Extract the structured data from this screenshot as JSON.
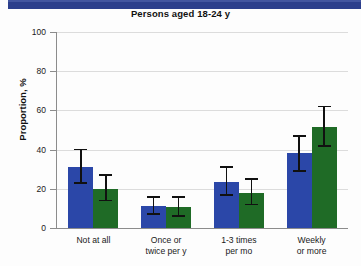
{
  "banner": {
    "color": "#2c3f8c"
  },
  "chart_data": {
    "type": "bar",
    "title": "Persons aged 18-24 y",
    "xlabel": "",
    "ylabel": "Proportion, %",
    "ylim": [
      0,
      100
    ],
    "yticks": [
      0,
      20,
      40,
      60,
      80,
      100
    ],
    "ytick_labels": [
      "0",
      "20",
      "40",
      "60",
      "80",
      "100"
    ],
    "grid": true,
    "legend": null,
    "colors": {
      "series1": "#2b47a8",
      "series2": "#1f6b26"
    },
    "categories": [
      "Not at all",
      "Once or twice per y",
      "1-3 times per mo",
      "Weekly or more"
    ],
    "category_lines": [
      [
        "Not at all"
      ],
      [
        "Once or",
        "twice per y"
      ],
      [
        "1-3 times",
        "per mo"
      ],
      [
        "Weekly",
        "or more"
      ]
    ],
    "series": [
      {
        "name": "series1",
        "color": "#2b47a8",
        "values": [
          31,
          11,
          23.5,
          38.5
        ],
        "err_low": [
          23,
          7,
          17,
          29
        ],
        "err_high": [
          40,
          16,
          31,
          47
        ]
      },
      {
        "name": "series2",
        "color": "#1f6b26",
        "values": [
          20,
          10.5,
          18,
          51.5
        ],
        "err_low": [
          14,
          6,
          12,
          42
        ],
        "err_high": [
          27,
          16,
          25,
          62
        ]
      }
    ]
  }
}
